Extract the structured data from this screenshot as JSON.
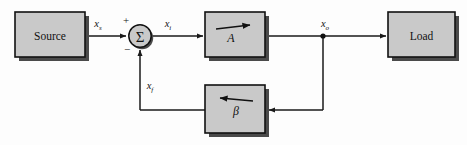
{
  "figure": {
    "background_color": "#fdfdfd"
  },
  "style": {
    "block_fill": "#c9c9c9",
    "block_stroke": "#111111",
    "shadow_fill": "#4a4a4a",
    "wire_color": "#1a1a1a",
    "node_color": "#111111"
  },
  "blocks": {
    "source": {
      "label": "Source"
    },
    "load": {
      "label": "Load"
    },
    "amplifier": {
      "label": "A",
      "arrow_direction": "right"
    },
    "feedback": {
      "label": "β",
      "arrow_direction": "left"
    },
    "summer": {
      "label": "Σ",
      "plus_sign": "+",
      "minus_sign": "−"
    }
  },
  "signals": {
    "source_signal": {
      "base": "x",
      "subscript": "s"
    },
    "input_signal": {
      "base": "x",
      "subscript": "i"
    },
    "output_signal": {
      "base": "x",
      "subscript": "o"
    },
    "feedback_signal": {
      "base": "x",
      "subscript": "f"
    }
  }
}
